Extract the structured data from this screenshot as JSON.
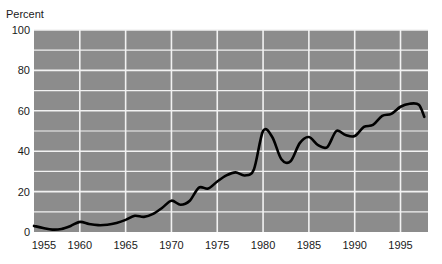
{
  "chart_data": {
    "type": "line",
    "title": "",
    "ylabel": "Percent",
    "xlabel": "",
    "xlim": [
      1955,
      1998
    ],
    "ylim": [
      0,
      100
    ],
    "grid": true,
    "legend": "none",
    "y_ticks": [
      0,
      20,
      40,
      60,
      80,
      100
    ],
    "y_tick_labels": [
      "0",
      "20",
      "40",
      "60",
      "80",
      "100"
    ],
    "y_minor_gridlines": [
      10,
      30,
      50,
      70,
      90
    ],
    "x_ticks": [
      1955,
      1960,
      1965,
      1970,
      1975,
      1980,
      1985,
      1990,
      1995
    ],
    "x_tick_labels": [
      "1955",
      "1960",
      "1965",
      "1970",
      "1975",
      "1980",
      "1985",
      "1990",
      "1995"
    ],
    "series": [
      {
        "name": "Percent",
        "x": [
          1955,
          1956,
          1957,
          1958,
          1959,
          1960,
          1961,
          1962,
          1963,
          1964,
          1965,
          1966,
          1967,
          1968,
          1969,
          1970,
          1971,
          1972,
          1973,
          1974,
          1975,
          1976,
          1977,
          1978,
          1979,
          1980,
          1981,
          1982,
          1983,
          1984,
          1985,
          1986,
          1987,
          1988,
          1989,
          1990,
          1991,
          1992,
          1993,
          1994,
          1995,
          1996,
          1997,
          1997.6
        ],
        "values": [
          3,
          2,
          1.2,
          1.5,
          3,
          5,
          4,
          3.4,
          3.6,
          4.5,
          6,
          8,
          7.5,
          9,
          12,
          15.5,
          13.5,
          15.5,
          22,
          21.5,
          25,
          28,
          29.5,
          28,
          31,
          50,
          47,
          36,
          35,
          44,
          47,
          43,
          42,
          50,
          48,
          47.5,
          52,
          53,
          57.5,
          58.5,
          62,
          63.5,
          63,
          57
        ]
      }
    ],
    "colors": {
      "plot_background": "#8c8c8c",
      "gridline": "#f2f2f2",
      "line": "#000000",
      "text": "#1a1a1a",
      "page_background": "#ffffff"
    }
  },
  "geometry": {
    "plot_left": 34,
    "plot_right": 428,
    "plot_top": 30,
    "plot_bottom": 232
  }
}
